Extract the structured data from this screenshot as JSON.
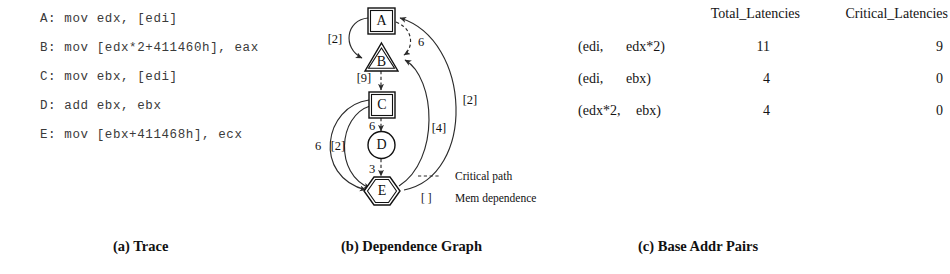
{
  "figure": {
    "captions": {
      "a": "(a) Trace",
      "b": "(b) Dependence Graph",
      "c": "(c) Base Addr Pairs"
    }
  },
  "trace": {
    "lines": [
      "A: mov edx, [edi]",
      "B: mov [edx*2+411460h], eax",
      "C: mov ebx, [edi]",
      "D: add ebx, ebx",
      "E: mov [ebx+411468h], ecx"
    ]
  },
  "graph": {
    "nodes": [
      {
        "id": "A",
        "label": "A",
        "shape": "square"
      },
      {
        "id": "B",
        "label": "B",
        "shape": "triangle"
      },
      {
        "id": "C",
        "label": "C",
        "shape": "square"
      },
      {
        "id": "D",
        "label": "D",
        "shape": "circle"
      },
      {
        "id": "E",
        "label": "E",
        "shape": "hexagon"
      }
    ],
    "edges": [
      {
        "from": "A",
        "to": "B",
        "label": "[2]",
        "style": "solid",
        "side": "left"
      },
      {
        "from": "A",
        "to": "B",
        "label": "6",
        "style": "dashed",
        "side": "right"
      },
      {
        "from": "B",
        "to": "C",
        "label": "[9]",
        "style": "dashed",
        "side": "center"
      },
      {
        "from": "C",
        "to": "D",
        "label": "6",
        "style": "dashed",
        "side": "center"
      },
      {
        "from": "D",
        "to": "E",
        "label": "3",
        "style": "dashed",
        "side": "center"
      },
      {
        "from": "C",
        "to": "E",
        "label": "6",
        "style": "solid",
        "side": "left-outer"
      },
      {
        "from": "C",
        "to": "E",
        "label": "[2]",
        "style": "solid",
        "side": "left-inner"
      },
      {
        "from": "E",
        "to": "B",
        "label": "[4]",
        "style": "solid",
        "side": "right-inner"
      },
      {
        "from": "E",
        "to": "B",
        "label": "[2]",
        "style": "solid",
        "side": "right-outer"
      }
    ],
    "legend": [
      {
        "symbol": "dashed-line",
        "text": "Critical path"
      },
      {
        "symbol": "[ ]",
        "text": "Mem dependence"
      }
    ]
  },
  "table": {
    "columns": [
      "",
      "Total_Latencies",
      "Critical_Latencies"
    ],
    "rows": [
      {
        "pair_left": "(edi,",
        "pair_right": "edx*2)",
        "total": "11",
        "critical": "9"
      },
      {
        "pair_left": "(edi,",
        "pair_right": "ebx)",
        "total": "4",
        "critical": "0"
      },
      {
        "pair_left": "(edx*2,",
        "pair_right": "ebx)",
        "total": "4",
        "critical": "0"
      }
    ]
  },
  "colors": {
    "ink": "#111111",
    "trace_ink": "#3a3a3a",
    "paper": "#ffffff"
  }
}
